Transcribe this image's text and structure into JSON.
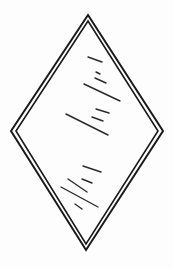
{
  "image": {
    "subject": "diamond-shaped glass pane line drawing",
    "width": 173,
    "height": 268,
    "colors": {
      "background": "#fdfdfd",
      "stroke": "#1a1a1a"
    },
    "shape": {
      "outer": {
        "top": [
          88,
          15
        ],
        "right": [
          163,
          131
        ],
        "bottom": [
          86,
          250
        ],
        "left": [
          11,
          131
        ]
      },
      "inner": {
        "top": [
          88,
          21
        ],
        "right": [
          158,
          131
        ],
        "bottom": [
          86,
          244
        ],
        "left": [
          16,
          131
        ]
      }
    },
    "glare_strokes": [
      [
        88,
        57,
        102,
        62
      ],
      [
        96,
        72,
        100,
        74
      ],
      [
        95,
        78,
        106,
        83
      ],
      [
        84,
        84,
        120,
        101
      ],
      [
        96,
        109,
        109,
        113
      ],
      [
        92,
        117,
        103,
        121
      ],
      [
        66,
        114,
        108,
        135
      ],
      [
        83,
        166,
        101,
        172
      ],
      [
        82,
        179,
        92,
        183
      ],
      [
        68,
        179,
        87,
        192
      ],
      [
        61,
        187,
        98,
        207
      ],
      [
        75,
        204,
        82,
        209
      ]
    ]
  }
}
